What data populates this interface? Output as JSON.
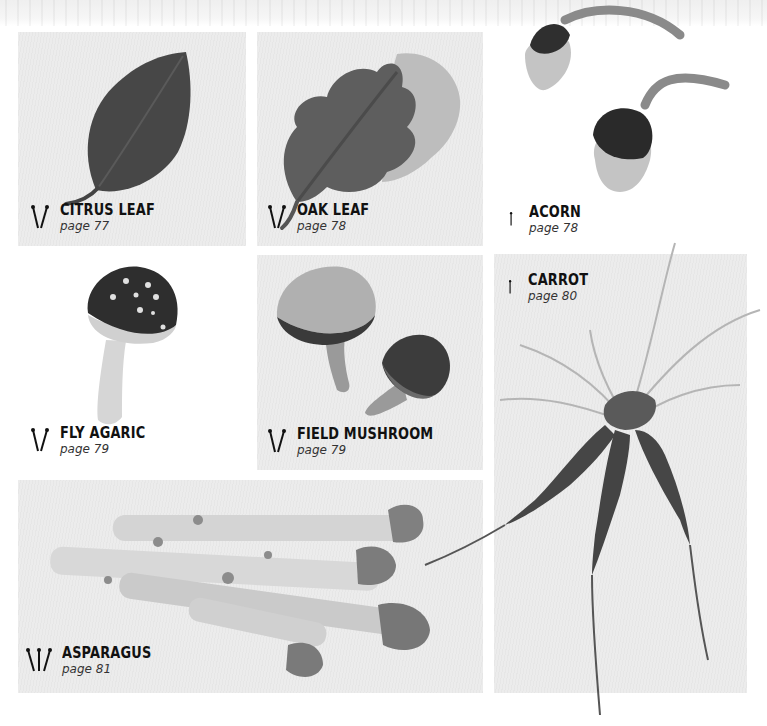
{
  "projects": [
    {
      "id": "citrus-leaf",
      "title": "CITRUS LEAF",
      "page": "page 77",
      "needle_count": 2
    },
    {
      "id": "oak-leaf",
      "title": "OAK LEAF",
      "page": "page 78",
      "needle_count": 2
    },
    {
      "id": "acorn",
      "title": "ACORN",
      "page": "page 78",
      "needle_count": 1
    },
    {
      "id": "fly-agaric",
      "title": "FLY AGARIC",
      "page": "page 79",
      "needle_count": 2
    },
    {
      "id": "field-mushroom",
      "title": "FIELD MUSHROOM",
      "page": "page 79",
      "needle_count": 2
    },
    {
      "id": "carrot",
      "title": "CARROT",
      "page": "page 80",
      "needle_count": 1
    },
    {
      "id": "asparagus",
      "title": "ASPARAGUS",
      "page": "page 81",
      "needle_count": 3
    }
  ],
  "icons": {
    "needles": "knitting-needles-icon"
  },
  "colors": {
    "panel_bg": "#ececec",
    "dark_knit": "#3e3e3e",
    "mid_knit": "#7a7a7a",
    "light_knit": "#cfcfcf",
    "text": "#111111"
  }
}
